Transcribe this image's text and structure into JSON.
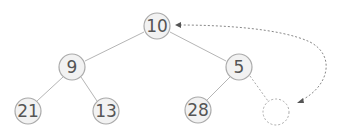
{
  "diagram": {
    "type": "binary-tree",
    "colors": {
      "node_fill": "#f2f2f2",
      "node_stroke": "#aaaaaa",
      "edge": "#b5b5b5",
      "dashed": "#aaaaaa",
      "text": "#555555"
    },
    "nodes": [
      {
        "id": "n10",
        "label": "10",
        "x": 157,
        "y": 26
      },
      {
        "id": "n9",
        "label": "9",
        "x": 72,
        "y": 67
      },
      {
        "id": "n5",
        "label": "5",
        "x": 239,
        "y": 67
      },
      {
        "id": "n21",
        "label": "21",
        "x": 28,
        "y": 111
      },
      {
        "id": "n13",
        "label": "13",
        "x": 106,
        "y": 111
      },
      {
        "id": "n28",
        "label": "28",
        "x": 198,
        "y": 110
      },
      {
        "id": "empty",
        "label": "",
        "x": 276,
        "y": 112,
        "dashed": true
      }
    ],
    "edges": [
      {
        "from": "n10",
        "to": "n9"
      },
      {
        "from": "n10",
        "to": "n5"
      },
      {
        "from": "n9",
        "to": "n21"
      },
      {
        "from": "n9",
        "to": "n13"
      },
      {
        "from": "n5",
        "to": "n28"
      },
      {
        "from": "n5",
        "to": "empty",
        "dashed": true
      }
    ],
    "arrow": {
      "style": "dotted",
      "direction": "bidirectional",
      "from": "empty-slot",
      "to": "n10"
    }
  }
}
